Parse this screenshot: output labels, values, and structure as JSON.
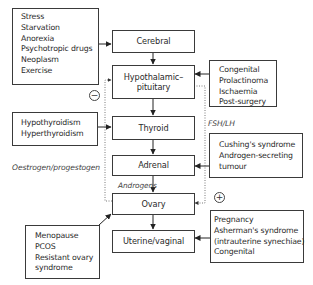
{
  "central_chain": [
    {
      "id": "cerebral",
      "label": "Cerebral"
    },
    {
      "id": "hypothalamic_pituitary",
      "label": "Hypothalamic– pituitary",
      "line1": "Hypothalamic–",
      "line2": "pituitary"
    },
    {
      "id": "thyroid",
      "label": "Thyroid"
    },
    {
      "id": "adrenal",
      "label": "Adrenal"
    },
    {
      "id": "ovary",
      "label": "Ovary"
    },
    {
      "id": "uterine_vaginal",
      "label": "Uterine/vaginal"
    }
  ],
  "cerebral_causes": {
    "targets": "cerebral",
    "items": [
      "Stress",
      "Starvation",
      "Anorexia",
      "Psychotropic drugs",
      "Neoplasm",
      "Exercise"
    ]
  },
  "pituitary_causes": {
    "targets": "hypothalamic_pituitary",
    "items": [
      "Congenital",
      "Prolactinoma",
      "Ischaemia",
      "Post-surgery"
    ]
  },
  "thyroid_causes": {
    "targets": "thyroid",
    "items": [
      "Hypothyroidism",
      "Hyperthyroidism"
    ]
  },
  "adrenal_causes": {
    "targets": "adrenal",
    "items": [
      "Cushing's syndrome",
      "Androgen-secreting",
      "tumour"
    ]
  },
  "ovary_causes": {
    "targets": "ovary",
    "items": [
      "Menopause",
      "PCOS",
      "Resistant ovary",
      "syndrome"
    ]
  },
  "uterine_causes": {
    "targets": "uterine_vaginal",
    "items": [
      "Pregnancy",
      "Asherman's syndrome",
      "(intrauterine synechiae)",
      "Congenital"
    ]
  },
  "feedback": {
    "negative": {
      "label": "Oestrogen/progestogen",
      "sign": "−",
      "from": "ovary",
      "to": "hypothalamic_pituitary"
    },
    "positive": {
      "label": "FSH/LH",
      "sign": "+",
      "from": "hypothalamic_pituitary",
      "to": "ovary"
    }
  },
  "edge_labels": {
    "androgens": "Androgens"
  }
}
